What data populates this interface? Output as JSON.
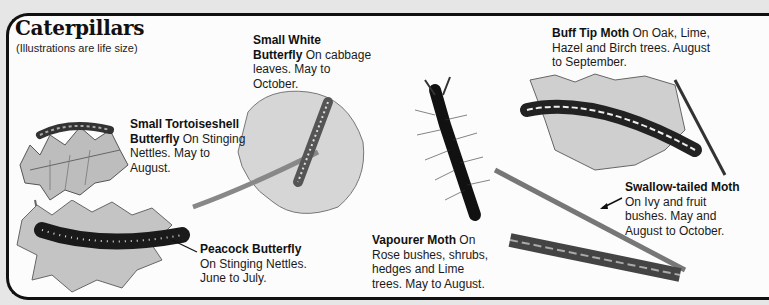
{
  "page": {
    "title": "Caterpillars",
    "subtitle": "(Illustrations are life size)"
  },
  "entries": [
    {
      "name": "Small White Butterfly",
      "name_line1": "Small White",
      "name_line2": "Butterfly",
      "desc_inline": " On cabbage",
      "desc_rest": "leaves. May to",
      "desc_rest2": "October."
    },
    {
      "name": "Buff Tip Moth",
      "desc_inline": " On Oak, Lime,",
      "desc_rest": "Hazel and Birch trees. August",
      "desc_rest2": "to September."
    },
    {
      "name": "Small Tortoiseshell Butterfly",
      "name_line1": "Small Tortoiseshell",
      "name_line2": "Butterfly",
      "desc_inline": " On Stinging",
      "desc_rest": "Nettles. May to",
      "desc_rest2": "August."
    },
    {
      "name": "Swallow-tailed Moth",
      "desc_rest": "On Ivy and fruit",
      "desc_rest2": "bushes. May and",
      "desc_rest3": "August to October."
    },
    {
      "name": "Peacock Butterfly",
      "desc_rest": "On Stinging Nettles.",
      "desc_rest2": "June to July."
    },
    {
      "name": "Vapourer Moth",
      "desc_inline": " On",
      "desc_rest": "Rose bushes, shrubs,",
      "desc_rest2": "hedges and Lime",
      "desc_rest3": "trees. May to August."
    }
  ]
}
